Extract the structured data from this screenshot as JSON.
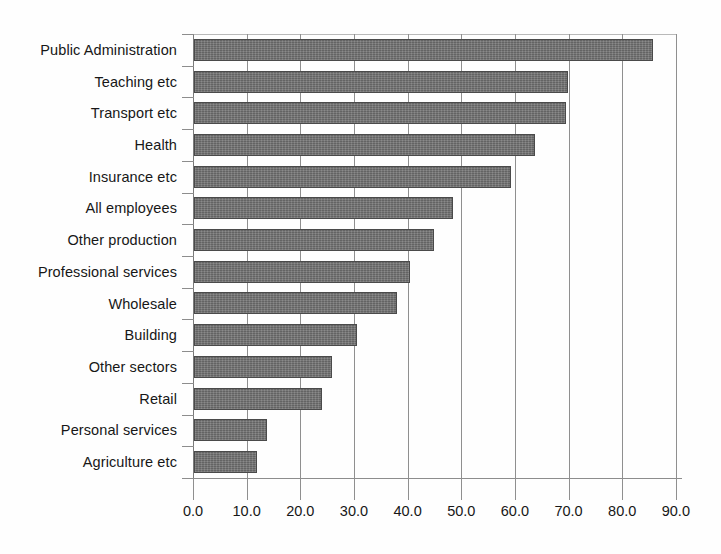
{
  "chart_data": {
    "type": "bar",
    "orientation": "horizontal",
    "title": "",
    "subtitle": "",
    "xlabel": "",
    "ylabel": "",
    "xlim": [
      0.0,
      90.0
    ],
    "xtick_step": 10.0,
    "xticks": [
      "0.0",
      "10.0",
      "20.0",
      "30.0",
      "40.0",
      "50.0",
      "60.0",
      "70.0",
      "80.0",
      "90.0"
    ],
    "grid": true,
    "grid_axis": "x",
    "legend": null,
    "bar_color": "#6f6f6f",
    "bar_edge_color": "#4a4a4a",
    "categories": [
      "Public Administration",
      "Teaching etc",
      "Transport etc",
      "Health",
      "Insurance etc",
      "All employees",
      "Other production",
      "Professional services",
      "Wholesale",
      "Building",
      "Other sectors",
      "Retail",
      "Personal services",
      "Agriculture etc"
    ],
    "values": [
      85.5,
      69.8,
      69.3,
      63.6,
      59.0,
      48.3,
      44.7,
      40.2,
      37.8,
      30.3,
      25.7,
      23.9,
      13.6,
      11.8
    ],
    "series": [
      {
        "name": "",
        "values": [
          85.5,
          69.8,
          69.3,
          63.6,
          59.0,
          48.3,
          44.7,
          40.2,
          37.8,
          30.3,
          25.7,
          23.9,
          13.6,
          11.8
        ]
      }
    ]
  }
}
